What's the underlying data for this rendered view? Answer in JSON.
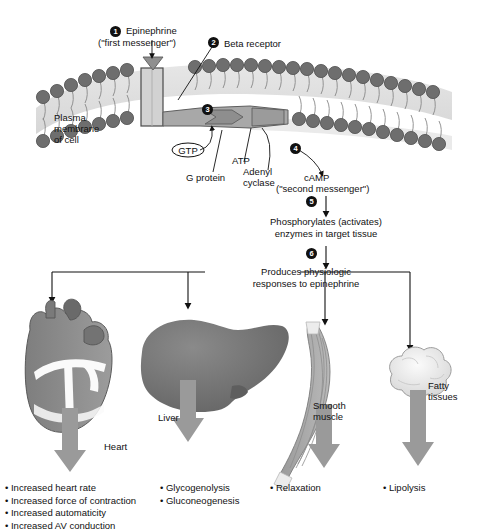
{
  "diagram": {
    "membrane": {
      "label_line1": "Plasma",
      "label_line2": "membrane",
      "label_line3": "of cell"
    },
    "steps": [
      {
        "n": "1",
        "label_line1": "Epinephrine",
        "label_line2": "(\"first messenger\")"
      },
      {
        "n": "2",
        "label_line1": "Beta receptor",
        "label_line2": ""
      },
      {
        "n": "3",
        "label_line1": "",
        "label_line2": ""
      },
      {
        "n": "4",
        "label_line1": "cAMP",
        "label_line2": "(\"second messenger\")"
      },
      {
        "n": "5",
        "label_line1": "Phosphorylates (activates)",
        "label_line2": "enzymes in target tissue"
      },
      {
        "n": "6",
        "label_line1": "Produces physiologic",
        "label_line2": "responses to epinephrine"
      }
    ],
    "molecules": {
      "gtp": "GTP",
      "g_protein": "G protein",
      "atp": "ATP",
      "adenyl_cyclase_line1": "Adenyl",
      "adenyl_cyclase_line2": "cyclase"
    },
    "targets": [
      {
        "name": "heart",
        "label_line1": "Heart",
        "label_line2": "",
        "effects": [
          "Increased heart rate",
          "Increased force of contraction",
          "Increased automaticity",
          "Increased AV conduction"
        ]
      },
      {
        "name": "liver",
        "label_line1": "Liver",
        "label_line2": "",
        "effects": [
          "Glycogenolysis",
          "Gluconeogenesis"
        ]
      },
      {
        "name": "smooth-muscle",
        "label_line1": "Smooth",
        "label_line2": "muscle",
        "effects": [
          "Relaxation"
        ]
      },
      {
        "name": "fatty-tissues",
        "label_line1": "Fatty",
        "label_line2": "tissues",
        "effects": [
          "Lipolysis"
        ]
      }
    ],
    "colors": {
      "ink": "#111111",
      "arrow_gray": "#9a9a9a",
      "lipid_head": "#6e6e6e",
      "membrane_fill": "#d8d8d8",
      "organ_dark": "#6b6b6b",
      "organ_mid": "#8d8d8d",
      "organ_light": "#e8e8e8"
    }
  }
}
